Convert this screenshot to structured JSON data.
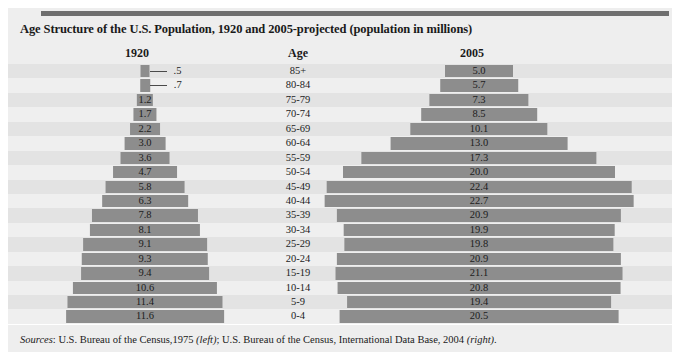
{
  "figure": {
    "title": "Age Structure of the U.S. Population, 1920 and 2005-projected (population in millions)",
    "columns": {
      "left": "1920",
      "center": "Age",
      "right": "2005"
    },
    "sources_prefix": "Sources",
    "sources_sep": ": ",
    "sources_a": "U.S. Bureau of the Census,1975 ",
    "sources_a_note": "(left)",
    "sources_mid": "; U.S. Bureau of the Census, International Data Base, 2004 ",
    "sources_b_note": "(right)",
    "sources_end": ".",
    "colors": {
      "bar": "#8d8d8d",
      "panel": "#eeeeee",
      "row_odd": "#e3e3e3",
      "row_even": "#efefef",
      "top_rule": "#6f6f6f",
      "text": "#1a1a1a"
    }
  },
  "chart_data": {
    "type": "bar",
    "subtype": "population-pyramid",
    "title": "Age Structure of the U.S. Population, 1920 and 2005-projected (population in millions)",
    "xlabel": "Population (millions)",
    "ylabel": "Age",
    "unit": "millions",
    "grid": false,
    "legend": "none",
    "orientation": "horizontal",
    "categories": [
      "85+",
      "80-84",
      "75-79",
      "70-74",
      "65-69",
      "60-64",
      "55-59",
      "50-54",
      "45-49",
      "40-44",
      "35-39",
      "30-34",
      "25-29",
      "20-24",
      "15-19",
      "10-14",
      "5-9",
      "0-4"
    ],
    "series": [
      {
        "name": "1920",
        "values": [
          0.5,
          0.7,
          1.2,
          1.7,
          2.2,
          3.0,
          3.6,
          4.7,
          5.8,
          6.3,
          7.8,
          8.1,
          9.1,
          9.3,
          9.4,
          10.6,
          11.4,
          11.6
        ],
        "labels": [
          ".5",
          ".7",
          "1.2",
          "1.7",
          "2.2",
          "3.0",
          "3.6",
          "4.7",
          "5.8",
          "6.3",
          "7.8",
          "8.1",
          "9.1",
          "9.3",
          "9.4",
          "10.6",
          "11.4",
          "11.6"
        ]
      },
      {
        "name": "2005",
        "values": [
          5.0,
          5.7,
          7.3,
          8.5,
          10.1,
          13.0,
          17.3,
          20.0,
          22.4,
          22.7,
          20.9,
          19.9,
          19.8,
          20.9,
          21.1,
          20.8,
          19.4,
          20.5
        ],
        "labels": [
          "5.0",
          "5.7",
          "7.3",
          "8.5",
          "10.1",
          "13.0",
          "17.3",
          "20.0",
          "22.4",
          "22.7",
          "20.9",
          "19.9",
          "19.8",
          "20.9",
          "21.1",
          "20.8",
          "19.4",
          "20.5"
        ]
      }
    ],
    "rows": [
      {
        "age": "85+",
        "v1920": 0.5,
        "l1920": ".5",
        "v2005": 5.0,
        "l2005": "5.0",
        "leader1920": true
      },
      {
        "age": "80-84",
        "v1920": 0.7,
        "l1920": ".7",
        "v2005": 5.7,
        "l2005": "5.7",
        "leader1920": true
      },
      {
        "age": "75-79",
        "v1920": 1.2,
        "l1920": "1.2",
        "v2005": 7.3,
        "l2005": "7.3",
        "leader1920": false
      },
      {
        "age": "70-74",
        "v1920": 1.7,
        "l1920": "1.7",
        "v2005": 8.5,
        "l2005": "8.5",
        "leader1920": false
      },
      {
        "age": "65-69",
        "v1920": 2.2,
        "l1920": "2.2",
        "v2005": 10.1,
        "l2005": "10.1",
        "leader1920": false
      },
      {
        "age": "60-64",
        "v1920": 3.0,
        "l1920": "3.0",
        "v2005": 13.0,
        "l2005": "13.0",
        "leader1920": false
      },
      {
        "age": "55-59",
        "v1920": 3.6,
        "l1920": "3.6",
        "v2005": 17.3,
        "l2005": "17.3",
        "leader1920": false
      },
      {
        "age": "50-54",
        "v1920": 4.7,
        "l1920": "4.7",
        "v2005": 20.0,
        "l2005": "20.0",
        "leader1920": false
      },
      {
        "age": "45-49",
        "v1920": 5.8,
        "l1920": "5.8",
        "v2005": 22.4,
        "l2005": "22.4",
        "leader1920": false
      },
      {
        "age": "40-44",
        "v1920": 6.3,
        "l1920": "6.3",
        "v2005": 22.7,
        "l2005": "22.7",
        "leader1920": false
      },
      {
        "age": "35-39",
        "v1920": 7.8,
        "l1920": "7.8",
        "v2005": 20.9,
        "l2005": "20.9",
        "leader1920": false
      },
      {
        "age": "30-34",
        "v1920": 8.1,
        "l1920": "8.1",
        "v2005": 19.9,
        "l2005": "19.9",
        "leader1920": false
      },
      {
        "age": "25-29",
        "v1920": 9.1,
        "l1920": "9.1",
        "v2005": 19.8,
        "l2005": "19.8",
        "leader1920": false
      },
      {
        "age": "20-24",
        "v1920": 9.3,
        "l1920": "9.3",
        "v2005": 20.9,
        "l2005": "20.9",
        "leader1920": false
      },
      {
        "age": "15-19",
        "v1920": 9.4,
        "l1920": "9.4",
        "v2005": 21.1,
        "l2005": "21.1",
        "leader1920": false
      },
      {
        "age": "10-14",
        "v1920": 10.6,
        "l1920": "10.6",
        "v2005": 20.8,
        "l2005": "20.8",
        "leader1920": false
      },
      {
        "age": "5-9",
        "v1920": 11.4,
        "l1920": "11.4",
        "v2005": 19.4,
        "l2005": "19.4",
        "leader1920": false
      },
      {
        "age": "0-4",
        "v1920": 11.6,
        "l1920": "11.6",
        "v2005": 20.5,
        "l2005": "20.5",
        "leader1920": false
      }
    ]
  }
}
